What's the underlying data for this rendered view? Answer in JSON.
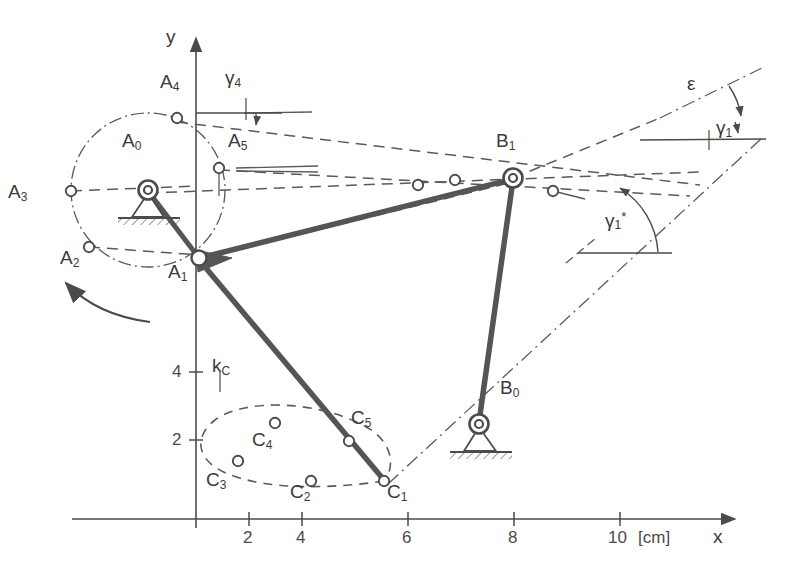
{
  "figure": {
    "kind": "kinematic-linkage-diagram",
    "stroke_color": "#4b4b4b",
    "thick_link_color": "#555555",
    "axes": {
      "x_name": "x",
      "y_name": "y",
      "unit_label": "[cm]",
      "x_ticks": [
        "2",
        "4",
        "6",
        "8",
        "10"
      ],
      "y_ticks": [
        "2",
        "4"
      ],
      "origin_px": [
        196,
        519
      ],
      "px_per_cm": 26.5
    },
    "points": [
      {
        "id": "A0",
        "label": "A",
        "sub": "0",
        "type": "ground-pivot",
        "x_px": 148,
        "y_px": 190,
        "label_px": [
          122,
          142
        ]
      },
      {
        "id": "A1",
        "label": "A",
        "sub": "1",
        "type": "moving-joint",
        "x_px": 199,
        "y_px": 259,
        "label_px": [
          168,
          268
        ]
      },
      {
        "id": "A2",
        "label": "A",
        "sub": "2",
        "type": "open-joint",
        "x_px": 89,
        "y_px": 247,
        "label_px": [
          60,
          252
        ]
      },
      {
        "id": "A3",
        "label": "A",
        "sub": "3",
        "type": "open-joint",
        "x_px": 71,
        "y_px": 191,
        "label_px": [
          10,
          188
        ]
      },
      {
        "id": "A4",
        "label": "A",
        "sub": "4",
        "type": "open-joint",
        "x_px": 177,
        "y_px": 118,
        "label_px": [
          160,
          78
        ]
      },
      {
        "id": "A5",
        "label": "A",
        "sub": "5",
        "type": "open-joint",
        "x_px": 219,
        "y_px": 168,
        "label_px": [
          228,
          137
        ]
      },
      {
        "id": "B0",
        "label": "B",
        "sub": "0",
        "type": "ground-pivot",
        "x_px": 479,
        "y_px": 424,
        "label_px": [
          500,
          385
        ]
      },
      {
        "id": "B1",
        "label": "B",
        "sub": "1",
        "type": "moving-joint",
        "x_px": 513,
        "y_px": 178,
        "label_px": [
          497,
          137
        ]
      },
      {
        "id": "C1",
        "label": "C",
        "sub": "1",
        "type": "open-joint",
        "x_px": 384,
        "y_px": 481,
        "label_px": [
          387,
          487
        ]
      },
      {
        "id": "C2",
        "label": "C",
        "sub": "2",
        "type": "open-joint",
        "x_px": 311,
        "y_px": 481,
        "label_px": [
          292,
          487
        ]
      },
      {
        "id": "C3",
        "label": "C",
        "sub": "3",
        "type": "open-joint",
        "x_px": 238,
        "y_px": 461,
        "label_px": [
          210,
          475
        ]
      },
      {
        "id": "C4",
        "label": "C",
        "sub": "4",
        "type": "open-joint",
        "x_px": 275,
        "y_px": 423,
        "label_px": [
          255,
          436
        ]
      },
      {
        "id": "C5",
        "label": "C",
        "sub": "5",
        "type": "open-joint",
        "x_px": 349,
        "y_px": 441,
        "label_px": [
          352,
          415
        ]
      },
      {
        "id": "Bx1",
        "label": "",
        "sub": "",
        "type": "open-joint",
        "x_px": 455,
        "y_px": 180,
        "label_px": [
          0,
          0
        ]
      },
      {
        "id": "Bx2",
        "label": "",
        "sub": "",
        "type": "open-joint",
        "x_px": 418,
        "y_px": 185,
        "label_px": [
          0,
          0
        ]
      },
      {
        "id": "Bx3",
        "label": "",
        "sub": "",
        "type": "open-joint",
        "x_px": 553,
        "y_px": 191,
        "label_px": [
          0,
          0
        ]
      }
    ],
    "curve_labels": [
      {
        "id": "kc",
        "label": "k",
        "sub": "C",
        "label_px": [
          216,
          362
        ]
      }
    ],
    "angle_labels": [
      {
        "id": "gamma4",
        "label": "γ",
        "sub": "4",
        "sup": "",
        "label_px": [
          228,
          74
        ]
      },
      {
        "id": "gamma1",
        "label": "γ",
        "sub": "1",
        "sup": "",
        "label_px": [
          719,
          125
        ]
      },
      {
        "id": "gamma1star",
        "label": "γ",
        "sub": "1",
        "sup": "*",
        "label_px": [
          608,
          218
        ]
      },
      {
        "id": "epsilon",
        "label": "ε",
        "sub": "",
        "sup": "",
        "label_px": [
          690,
          80
        ]
      }
    ],
    "rotation_arrow": {
      "direction": "counterclockwise",
      "label": ""
    }
  }
}
